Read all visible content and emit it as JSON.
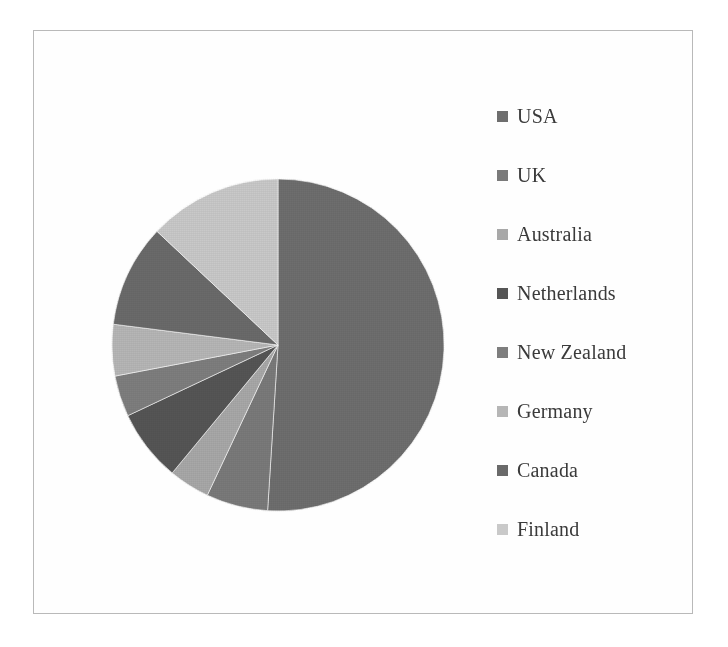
{
  "figure": {
    "background": "#ffffff",
    "frame_color": "#b9b9b9"
  },
  "legend": {
    "position": "right",
    "items": [
      {
        "label": "USA",
        "color": "#6e6e6e"
      },
      {
        "label": "UK",
        "color": "#7a7a7a"
      },
      {
        "label": "Australia",
        "color": "#a8a8a8"
      },
      {
        "label": "Netherlands",
        "color": "#555555"
      },
      {
        "label": "New Zealand",
        "color": "#7e7e7e"
      },
      {
        "label": "Germany",
        "color": "#b6b6b6"
      },
      {
        "label": "Canada",
        "color": "#6a6a6a"
      },
      {
        "label": "Finland",
        "color": "#c9c9c9"
      }
    ]
  },
  "chart_data": {
    "type": "pie",
    "title": "",
    "labels": [
      "USA",
      "UK",
      "Australia",
      "Netherlands",
      "New Zealand",
      "Germany",
      "Canada",
      "Finland"
    ],
    "values": [
      51.0,
      6.0,
      4.0,
      7.0,
      4.0,
      5.0,
      10.0,
      13.0
    ],
    "unit": "percent",
    "start_angle_deg": 0,
    "direction": "clockwise",
    "colors": [
      "#6e6e6e",
      "#7a7a7a",
      "#a8a8a8",
      "#555555",
      "#7e7e7e",
      "#b6b6b6",
      "#6a6a6a",
      "#c9c9c9"
    ],
    "legend": true,
    "legend_position": "right",
    "data_labels": false,
    "grid": false
  },
  "geometry": {
    "center_x": 167,
    "center_y": 167,
    "radius": 166
  }
}
